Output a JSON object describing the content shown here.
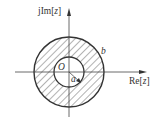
{
  "diagram": {
    "axes": {
      "y_label_prefix": "jIm[",
      "y_label_var": "z",
      "y_label_suffix": "]",
      "x_label_prefix": "Re[",
      "x_label_var": "z",
      "x_label_suffix": "]"
    },
    "origin_label": "O",
    "inner_radius_label": "a",
    "outer_radius_label": "b",
    "region": "a < |z| < b (hatched annulus)",
    "colors": {
      "stroke": "#333333",
      "hatch": "#555555",
      "background": "#ffffff"
    }
  }
}
